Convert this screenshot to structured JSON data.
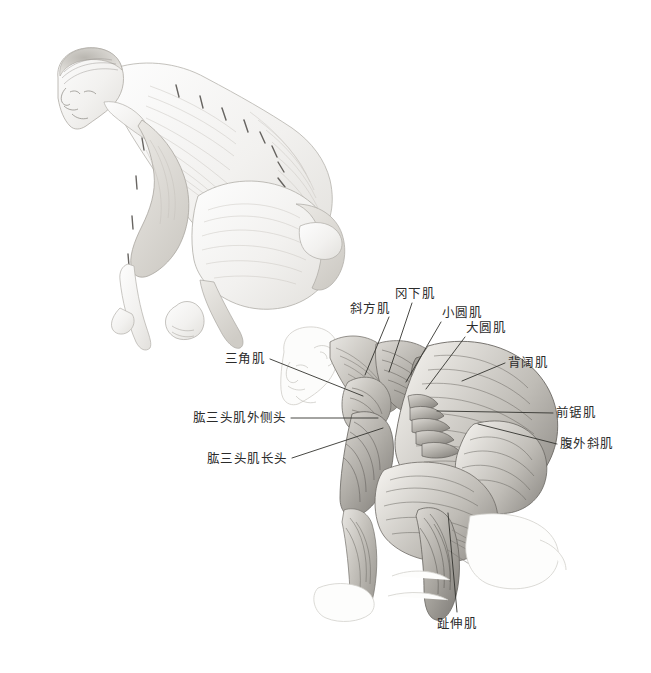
{
  "page": {
    "background_color": "#ffffff",
    "width": 651,
    "height": 673,
    "label_text_color": "#2b2b2b",
    "leader_line_color": "#33332f",
    "drawing_medium": "graphite pencil study"
  },
  "figures": [
    {
      "id": "upper-figure",
      "name": "surface-anatomy-crouching-figure",
      "description": "Pencil drawing of a nude male figure crouching, seen from the left side, head lowered, arms folded across the knees",
      "bounds": {
        "x": 38,
        "y": 45,
        "width": 310,
        "height": 290
      },
      "labeled": false
    },
    {
      "id": "lower-figure",
      "name": "muscle-anatomy-crouching-figure",
      "description": "Ecorche pencil drawing of the same crouching pose showing superficial back, shoulder and leg musculature with a lightly outlined head",
      "bounds": {
        "x": 262,
        "y": 330,
        "width": 320,
        "height": 300
      },
      "labeled": true
    }
  ],
  "labels": [
    {
      "id": "trapezius",
      "text": "斜方肌",
      "text_x": 350,
      "text_y": 302,
      "anchor_x": 389,
      "anchor_y": 317,
      "tip_x": 365,
      "tip_y": 375,
      "side": "top"
    },
    {
      "id": "infraspinatus",
      "text": "冈下肌",
      "text_x": 395,
      "text_y": 287,
      "anchor_x": 412,
      "anchor_y": 303,
      "tip_x": 389,
      "tip_y": 372,
      "side": "top"
    },
    {
      "id": "teres-minor",
      "text": "小圆肌",
      "text_x": 442,
      "text_y": 306,
      "anchor_x": 441,
      "anchor_y": 322,
      "tip_x": 406,
      "tip_y": 382,
      "side": "top"
    },
    {
      "id": "teres-major",
      "text": "大圆肌",
      "text_x": 466,
      "text_y": 321,
      "anchor_x": 465,
      "anchor_y": 337,
      "tip_x": 426,
      "tip_y": 389,
      "side": "top"
    },
    {
      "id": "latissimus-dorsi",
      "text": "背阔肌",
      "text_x": 508,
      "text_y": 356,
      "anchor_x": 505,
      "anchor_y": 363,
      "tip_x": 462,
      "tip_y": 381,
      "side": "right"
    },
    {
      "id": "serratus-anterior",
      "text": "前锯肌",
      "text_x": 556,
      "text_y": 406,
      "anchor_x": 553,
      "anchor_y": 413,
      "tip_x": 437,
      "tip_y": 411,
      "side": "right"
    },
    {
      "id": "external-oblique",
      "text": "腹外斜肌",
      "text_x": 560,
      "text_y": 437,
      "anchor_x": 557,
      "anchor_y": 444,
      "tip_x": 478,
      "tip_y": 424,
      "side": "right"
    },
    {
      "id": "deltoid",
      "text": "三角肌",
      "text_x": 225,
      "text_y": 352,
      "anchor_x": 270,
      "anchor_y": 359,
      "tip_x": 363,
      "tip_y": 396,
      "side": "left"
    },
    {
      "id": "triceps-lateral-head",
      "text": "肱三头肌外侧头",
      "text_x": 193,
      "text_y": 411,
      "anchor_x": 291,
      "anchor_y": 418,
      "tip_x": 378,
      "tip_y": 418,
      "side": "left"
    },
    {
      "id": "triceps-long-head",
      "text": "肱三头肌长头",
      "text_x": 207,
      "text_y": 452,
      "anchor_x": 292,
      "anchor_y": 458,
      "tip_x": 383,
      "tip_y": 428,
      "side": "left"
    },
    {
      "id": "extensor-digitorum",
      "text": "趾伸肌",
      "text_x": 437,
      "text_y": 617,
      "anchor_x": 457,
      "anchor_y": 612,
      "tip_x": 448,
      "tip_y": 513,
      "side": "bottom"
    }
  ]
}
